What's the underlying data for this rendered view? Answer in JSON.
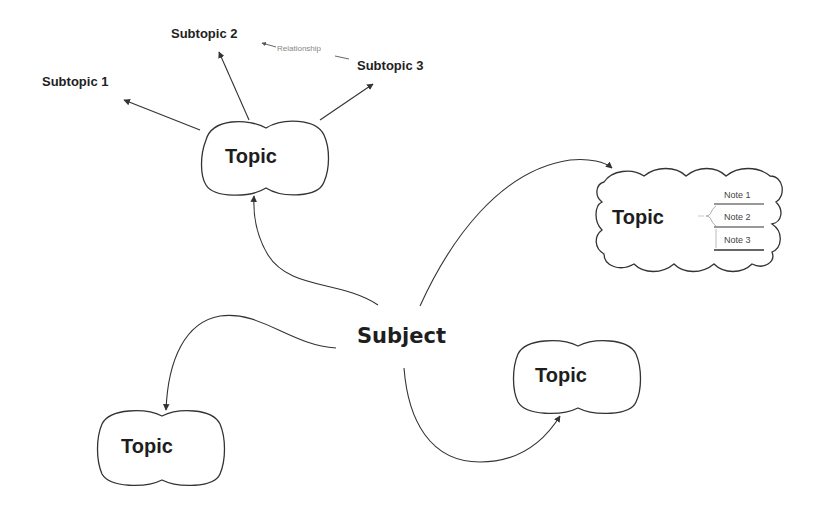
{
  "diagram": {
    "type": "mind-map",
    "central": {
      "label": "Subject"
    },
    "topics": [
      {
        "id": "topic-top-left",
        "label": "Topic",
        "shape": "double-cloud",
        "subtopics": [
          {
            "label": "Subtopic 1"
          },
          {
            "label": "Subtopic 2"
          },
          {
            "label": "Subtopic 3"
          }
        ]
      },
      {
        "id": "topic-right",
        "label": "Topic",
        "shape": "cloud",
        "notes": [
          {
            "label": "Note 1"
          },
          {
            "label": "Note 2"
          },
          {
            "label": "Note 3"
          }
        ]
      },
      {
        "id": "topic-bottom-right",
        "label": "Topic",
        "shape": "double-cloud"
      },
      {
        "id": "topic-bottom-left",
        "label": "Topic",
        "shape": "double-cloud"
      }
    ],
    "relationship": {
      "label": "Relationship",
      "from": "Subtopic 3",
      "to": "Subtopic 2"
    }
  },
  "colors": {
    "stroke": "#333333",
    "text": "#1e1e1e",
    "relationship_text": "#888888",
    "background": "#ffffff"
  }
}
